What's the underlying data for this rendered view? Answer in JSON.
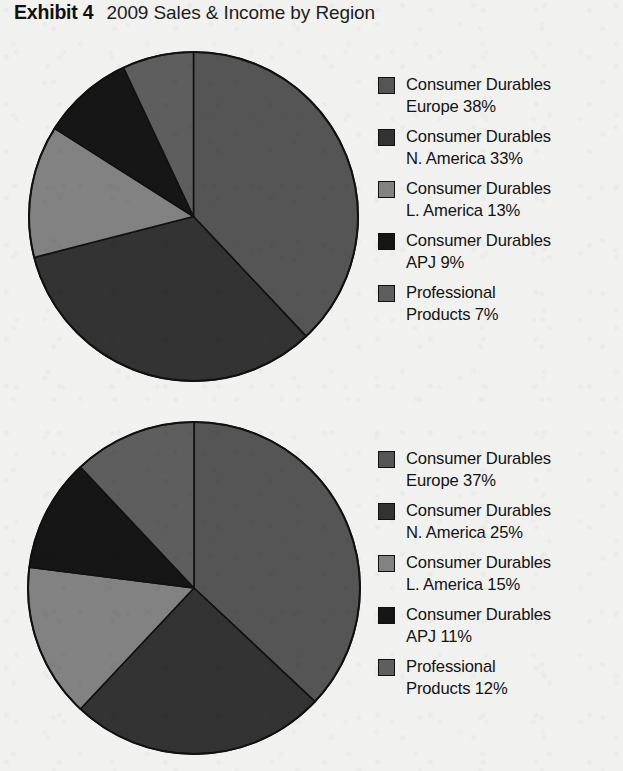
{
  "title": {
    "lead": "Exhibit 4",
    "rest": "2009 Sales & Income by Region"
  },
  "palette": {
    "europe": "#555555",
    "n_america": "#333333",
    "l_america": "#828282",
    "apj": "#161616",
    "professional": "#5e5e5e",
    "outline": "#111111",
    "background": "#f1f1ef"
  },
  "chart_data": [
    {
      "type": "pie",
      "title": "2009 Sales by Region",
      "chart_index": 1,
      "start_angle": 0,
      "direction": "clockwise",
      "legend_position": "right",
      "grid": false,
      "categories": [
        "Consumer Durables Europe",
        "Consumer Durables N. America",
        "Consumer Durables L. America",
        "Consumer Durables APJ",
        "Professional Products"
      ],
      "values": [
        38,
        33,
        13,
        9,
        7
      ],
      "unit": "%",
      "colors": [
        "#555555",
        "#333333",
        "#828282",
        "#161616",
        "#5e5e5e"
      ],
      "slices": [
        {
          "label": "Consumer Durables\nEurope 38%",
          "name": "Consumer Durables Europe",
          "value": 38,
          "color": "#555555"
        },
        {
          "label": "Consumer Durables\nN. America 33%",
          "name": "Consumer Durables N. America",
          "value": 33,
          "color": "#333333"
        },
        {
          "label": "Consumer Durables\nL. America 13%",
          "name": "Consumer Durables L. America",
          "value": 13,
          "color": "#828282"
        },
        {
          "label": "Consumer Durables\nAPJ 9%",
          "name": "Consumer Durables APJ",
          "value": 9,
          "color": "#161616"
        },
        {
          "label": "Professional\nProducts 7%",
          "name": "Professional Products",
          "value": 7,
          "color": "#5e5e5e"
        }
      ]
    },
    {
      "type": "pie",
      "title": "2009 Income by Region",
      "chart_index": 2,
      "start_angle": 0,
      "direction": "clockwise",
      "legend_position": "right",
      "grid": false,
      "categories": [
        "Consumer Durables Europe",
        "Consumer Durables N. America",
        "Consumer Durables L. America",
        "Consumer Durables APJ",
        "Professional Products"
      ],
      "values": [
        37,
        25,
        15,
        11,
        12
      ],
      "unit": "%",
      "colors": [
        "#555555",
        "#333333",
        "#828282",
        "#161616",
        "#5e5e5e"
      ],
      "slices": [
        {
          "label": "Consumer Durables\nEurope 37%",
          "name": "Consumer Durables Europe",
          "value": 37,
          "color": "#555555"
        },
        {
          "label": "Consumer Durables\nN. America 25%",
          "name": "Consumer Durables N. America",
          "value": 25,
          "color": "#333333"
        },
        {
          "label": "Consumer Durables\nL. America 15%",
          "name": "Consumer Durables L. America",
          "value": 15,
          "color": "#828282"
        },
        {
          "label": "Consumer Durables\nAPJ 11%",
          "name": "Consumer Durables APJ",
          "value": 11,
          "color": "#161616"
        },
        {
          "label": "Professional\nProducts 12%",
          "name": "Professional Products",
          "value": 12,
          "color": "#5e5e5e"
        }
      ]
    }
  ]
}
